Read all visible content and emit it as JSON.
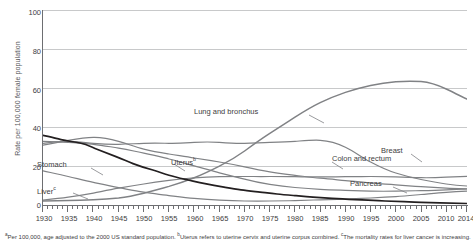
{
  "chart_data": {
    "type": "line",
    "title": "",
    "xlabel": "",
    "ylabel": "Rate per 100,000 female population",
    "xlim": [
      1930,
      2014
    ],
    "ylim": [
      0,
      100
    ],
    "yticks": [
      0,
      20,
      40,
      60,
      80,
      100
    ],
    "xticks": [
      1930,
      1935,
      1940,
      1945,
      1950,
      1955,
      1960,
      1965,
      1970,
      1975,
      1980,
      1985,
      1990,
      1995,
      2000,
      2005,
      2010,
      2014
    ],
    "grid": true,
    "legend_position": "inline-labels",
    "series": [
      {
        "name": "Lung and bronchus",
        "color": "#808285",
        "label_position": "inline",
        "x": [
          1930,
          1935,
          1940,
          1945,
          1950,
          1955,
          1960,
          1965,
          1970,
          1975,
          1980,
          1985,
          1990,
          1995,
          2000,
          2005,
          2010,
          2014
        ],
        "values": [
          2.5,
          2.6,
          2.8,
          3.2,
          4.5,
          5.2,
          6.5,
          8.5,
          11.5,
          15.5,
          21.0,
          27.0,
          32.5,
          36.0,
          38.5,
          40.5,
          38.5,
          36.0
        ]
      },
      {
        "name": "Breast",
        "color": "#808285",
        "label_position": "inline",
        "x": [
          1930,
          1935,
          1940,
          1945,
          1950,
          1955,
          1960,
          1965,
          1970,
          1975,
          1980,
          1985,
          1990,
          1995,
          2000,
          2005,
          2010,
          2014
        ],
        "values": [
          32.0,
          32.5,
          32.0,
          31.5,
          31.5,
          31.5,
          31.5,
          32.0,
          32.0,
          31.5,
          31.5,
          32.0,
          33.0,
          30.5,
          27.0,
          24.5,
          22.5,
          21.0
        ]
      },
      {
        "name": "Colon and rectum",
        "color": "#808285",
        "label_position": "inline",
        "x": [
          1930,
          1935,
          1940,
          1945,
          1950,
          1955,
          1960,
          1965,
          1970,
          1975,
          1980,
          1985,
          1990,
          1995,
          2000,
          2005,
          2010,
          2014
        ],
        "values": [
          31.0,
          32.0,
          33.5,
          33.0,
          31.0,
          29.5,
          28.0,
          26.5,
          25.0,
          23.0,
          21.0,
          19.5,
          18.5,
          17.0,
          16.0,
          15.0,
          14.0,
          13.5
        ]
      },
      {
        "name": "Stomach",
        "color": "#231f20",
        "label_position": "inline",
        "x": [
          1930,
          1935,
          1940,
          1945,
          1950,
          1955,
          1960,
          1965,
          1970,
          1975,
          1980,
          1985,
          1990,
          1995,
          2000,
          2005,
          2010,
          2014
        ],
        "values": [
          36.0,
          33.0,
          29.0,
          25.0,
          21.0,
          17.5,
          14.5,
          12.0,
          9.5,
          7.5,
          6.0,
          5.0,
          4.3,
          3.8,
          3.4,
          3.1,
          2.8,
          2.6
        ]
      },
      {
        "name": "Uterus",
        "color": "#808285",
        "label_superscript": "b",
        "label_position": "inline",
        "x": [
          1930,
          1935,
          1940,
          1945,
          1950,
          1955,
          1960,
          1965,
          1970,
          1975,
          1980,
          1985,
          1990,
          1995,
          2000,
          2005,
          2010,
          2014
        ],
        "values": [
          33.0,
          32.5,
          31.5,
          29.5,
          27.0,
          23.5,
          20.0,
          16.5,
          13.5,
          11.0,
          9.0,
          7.8,
          7.0,
          6.5,
          6.2,
          6.3,
          6.6,
          7.0
        ]
      },
      {
        "name": "Pancreas",
        "color": "#808285",
        "label_position": "inline",
        "x": [
          1930,
          1935,
          1940,
          1945,
          1950,
          1955,
          1960,
          1965,
          1970,
          1975,
          1980,
          1985,
          1990,
          1995,
          2000,
          2005,
          2010,
          2014
        ],
        "values": [
          3.0,
          3.5,
          4.2,
          5.0,
          6.0,
          6.8,
          7.5,
          8.2,
          8.8,
          9.2,
          9.3,
          9.3,
          9.3,
          9.2,
          9.1,
          9.2,
          9.5,
          9.8
        ]
      },
      {
        "name": "Liver",
        "color": "#808285",
        "label_superscript": "c",
        "label_position": "inline",
        "x": [
          1930,
          1935,
          1940,
          1945,
          1950,
          1955,
          1960,
          1965,
          1970,
          1975,
          1980,
          1985,
          1990,
          1995,
          2000,
          2005,
          2010,
          2014
        ],
        "values": [
          18.0,
          16.0,
          14.0,
          12.0,
          10.0,
          8.5,
          7.0,
          6.0,
          5.2,
          4.6,
          4.3,
          4.2,
          4.3,
          4.5,
          4.8,
          5.2,
          5.8,
          6.2
        ]
      }
    ],
    "annotations": [
      {
        "text": "Lung and bronchus",
        "x_px": 303,
        "y_px": 112
      },
      {
        "text": "Breast",
        "x_px": 414,
        "y_px": 151
      },
      {
        "text": "Colon and rectum",
        "x_px": 333,
        "y_px": 160
      },
      {
        "text": "Stomach",
        "x_px": 38,
        "y_px": 165
      },
      {
        "text": "Uterus",
        "x_px": 186,
        "y_px": 161
      },
      {
        "text": "Pancreas",
        "x_px": 350,
        "y_px": 184
      },
      {
        "text": "Liver",
        "x_px": 38,
        "y_px": 190
      }
    ]
  },
  "axis": {
    "ylabel": "Rate per 100,000 female population",
    "yticks": [
      "100",
      "80",
      "60",
      "40",
      "20",
      "0"
    ],
    "xticks": [
      "1930",
      "1935",
      "1940",
      "1945",
      "1950",
      "1955",
      "1960",
      "1965",
      "1970",
      "1975",
      "1980",
      "1985",
      "1990",
      "1995",
      "2000",
      "2005",
      "2010",
      "2014"
    ]
  },
  "labels": {
    "lung": "Lung and bronchus",
    "breast": "Breast",
    "colon": "Colon and rectum",
    "stomach": "Stomach",
    "uterus": "Uterus",
    "uterus_sup": "b",
    "pancreas": "Pancreas",
    "liver": "Liver",
    "liver_sup": "c"
  },
  "footnote": {
    "sup_a": "a",
    "text_a": "Per 100,000, age adjusted to the 2000 US standard population. ",
    "sup_b": "b",
    "text_b": "Uterus refers to uterine cervix and uterine corpus combined. ",
    "sup_c": "c",
    "text_c": "The mortality rates for liver cancer is increasing."
  },
  "colors": {
    "dark_series": "#231f20",
    "gray_series": "#808285",
    "grid": "#c8c9ca",
    "axis": "#6d6e71",
    "text": "#414042"
  }
}
